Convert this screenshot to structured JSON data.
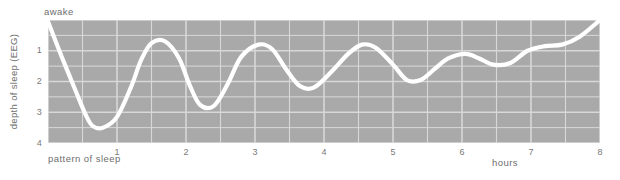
{
  "figure": {
    "awake_label": "awake",
    "y_axis_title": "depth of sleep (EEG)",
    "x_axis_title_left": "pattern of sleep",
    "x_axis_title_right": "hours"
  },
  "colors": {
    "plot_background": "#a9a9a9",
    "gridline": "#d8d8d8",
    "curve": "#ffffff",
    "text": "#6e6e6e",
    "page_background": "#ffffff"
  },
  "chart_data": {
    "type": "line",
    "title": "",
    "subtitle": "",
    "xlabel": "hours",
    "ylabel": "depth of sleep (EEG)",
    "annotations": [
      "awake",
      "pattern of sleep"
    ],
    "xlim": [
      0,
      8
    ],
    "ylim": [
      0,
      4
    ],
    "y_inverted": true,
    "grid": true,
    "legend": null,
    "x_ticks": [
      0,
      1,
      2,
      3,
      4,
      5,
      6,
      7,
      8
    ],
    "x_tick_labels": [
      "",
      "1",
      "2",
      "3",
      "4",
      "5",
      "6",
      "7",
      "8"
    ],
    "y_ticks": [
      0,
      1,
      2,
      3,
      4
    ],
    "y_tick_labels": [
      "awake",
      "1",
      "2",
      "3",
      "4"
    ],
    "x_minor_gridlines": [
      0.5,
      1.5,
      2.5,
      3.5,
      4.5,
      5.5,
      6.5,
      7.5
    ],
    "series": [
      {
        "name": "sleep depth",
        "x": [
          0.0,
          0.2,
          0.4,
          0.55,
          0.65,
          0.8,
          1.0,
          1.2,
          1.35,
          1.5,
          1.7,
          1.9,
          2.05,
          2.2,
          2.4,
          2.6,
          2.8,
          3.05,
          3.25,
          3.45,
          3.65,
          3.85,
          4.1,
          4.35,
          4.55,
          4.75,
          5.0,
          5.2,
          5.4,
          5.6,
          5.8,
          6.05,
          6.25,
          6.45,
          6.7,
          6.95,
          7.2,
          7.45,
          7.7,
          8.0
        ],
        "y": [
          0.05,
          1.2,
          2.3,
          3.1,
          3.45,
          3.5,
          3.15,
          2.2,
          1.3,
          0.75,
          0.7,
          1.25,
          2.1,
          2.75,
          2.8,
          2.1,
          1.2,
          0.8,
          0.95,
          1.6,
          2.15,
          2.2,
          1.7,
          1.1,
          0.8,
          0.9,
          1.45,
          1.95,
          1.95,
          1.6,
          1.25,
          1.1,
          1.25,
          1.45,
          1.4,
          1.0,
          0.85,
          0.8,
          0.55,
          0.0
        ]
      }
    ]
  }
}
